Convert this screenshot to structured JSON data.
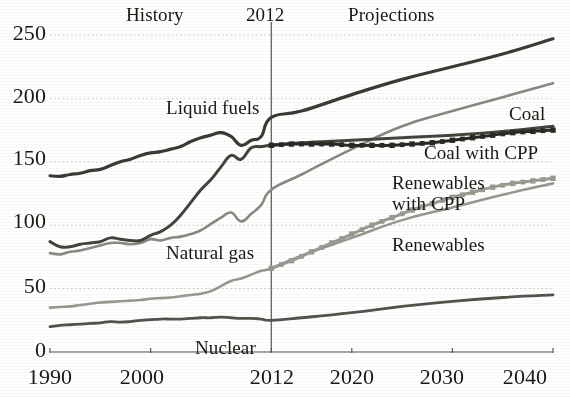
{
  "chart_data": {
    "type": "line",
    "title": "",
    "subtitle": "",
    "xlabel": "",
    "ylabel": "",
    "xlim": [
      1990,
      2040
    ],
    "ylim": [
      0,
      250
    ],
    "yticks": [
      0,
      50,
      100,
      150,
      200,
      250
    ],
    "xticks": [
      1990,
      2000,
      2012,
      2020,
      2030,
      2040
    ],
    "ytick_labels": [
      "0",
      "50",
      "100",
      "150",
      "200",
      "250"
    ],
    "xtick_labels": [
      "1990",
      "2000",
      "2012",
      "2020",
      "2030",
      "2040"
    ],
    "grid": "horizontal-dotted",
    "legend": "inline-annotations",
    "annotations": [
      {
        "name": "history-label",
        "text": "History",
        "x": 1997.2,
        "y": 262
      },
      {
        "name": "divider-year-label",
        "text": "2012",
        "x": 2012,
        "y": 262
      },
      {
        "name": "projections-label",
        "text": "Projections",
        "x": 2027.5,
        "y": 262
      }
    ],
    "divider_x": 2012,
    "series": [
      {
        "name": "Liquid fuels",
        "label": "Liquid fuels",
        "style": "solid",
        "color": "#3d3a34",
        "width": 3.2,
        "label_pos": {
          "x": 2001.0,
          "y": 191
        },
        "x": [
          1990,
          1991,
          1992,
          1993,
          1994,
          1995,
          1996,
          1997,
          1998,
          1999,
          2000,
          2001,
          2002,
          2003,
          2004,
          2005,
          2006,
          2007,
          2008,
          2009,
          2010,
          2011,
          2012,
          2015,
          2020,
          2025,
          2030,
          2035,
          2040
        ],
        "y": [
          139,
          138.5,
          140,
          141,
          143,
          144,
          147,
          150,
          152,
          155,
          157,
          158,
          160,
          162,
          166,
          169,
          171,
          173,
          170,
          163,
          167,
          170,
          185,
          190,
          203,
          215,
          225,
          235,
          247
        ]
      },
      {
        "name": "Natural gas",
        "label": "Natural gas",
        "style": "solid",
        "color": "#8b8881",
        "width": 2.6,
        "label_pos": {
          "x": 2002.0,
          "y": 82
        },
        "x": [
          1990,
          1991,
          1992,
          1993,
          1994,
          1995,
          1996,
          1997,
          1998,
          1999,
          2000,
          2001,
          2002,
          2003,
          2004,
          2005,
          2006,
          2007,
          2008,
          2009,
          2010,
          2011,
          2012,
          2015,
          2020,
          2025,
          2030,
          2035,
          2040
        ],
        "y": [
          78,
          77,
          79,
          80,
          82,
          84,
          86,
          86,
          85,
          86,
          89,
          88,
          90,
          91,
          93,
          96,
          101,
          106,
          110,
          103,
          109,
          116,
          128,
          140,
          160,
          178,
          190,
          201,
          212
        ]
      },
      {
        "name": "Coal",
        "label": "Coal",
        "style": "solid",
        "color": "#46433c",
        "width": 3.0,
        "label_pos": {
          "x": 2035.5,
          "y": 180
        },
        "x": [
          1990,
          1991,
          1992,
          1993,
          1994,
          1995,
          1996,
          1997,
          1998,
          1999,
          2000,
          2001,
          2002,
          2003,
          2004,
          2005,
          2006,
          2007,
          2008,
          2009,
          2010,
          2011,
          2012,
          2015,
          2020,
          2025,
          2030,
          2035,
          2040
        ],
        "y": [
          87,
          83,
          83,
          85,
          86,
          87,
          90,
          89,
          88,
          88,
          92,
          95,
          100,
          108,
          118,
          128,
          136,
          146,
          155,
          152,
          161,
          162,
          163,
          165,
          167,
          169,
          171,
          174,
          178
        ]
      },
      {
        "name": "Coal with CPP",
        "label": "Coal with CPP",
        "style": "dotted-markers",
        "color": "#2b2924",
        "width": 3.0,
        "label_pos": {
          "x": 2030.5,
          "y": 162
        },
        "x": [
          2012,
          2014,
          2016,
          2018,
          2020,
          2022,
          2024,
          2026,
          2028,
          2030,
          2032,
          2034,
          2036,
          2038,
          2040
        ],
        "y": [
          163,
          164,
          164,
          164,
          163,
          163,
          163,
          164,
          165,
          167,
          169,
          171,
          173,
          174,
          175
        ]
      },
      {
        "name": "Renewables",
        "label": "Renewables",
        "style": "solid",
        "color": "#9a978f",
        "width": 2.6,
        "label_pos": {
          "x": 2027.0,
          "y": 105
        },
        "x": [
          1990,
          1991,
          1992,
          1993,
          1994,
          1995,
          1996,
          1997,
          1998,
          1999,
          2000,
          2001,
          2002,
          2003,
          2004,
          2005,
          2006,
          2007,
          2008,
          2009,
          2010,
          2011,
          2012,
          2015,
          2020,
          2025,
          2030,
          2035,
          2040
        ],
        "y": [
          35,
          35.5,
          36,
          37,
          38,
          39,
          39.5,
          40,
          40.5,
          41,
          42,
          42.5,
          43,
          44,
          45,
          46,
          48,
          52,
          56,
          58,
          61,
          64,
          66,
          76,
          90,
          104,
          114,
          124,
          133
        ]
      },
      {
        "name": "Renewables with CPP",
        "label": "Renewables with CPP",
        "style": "dotted-markers",
        "color": "#9c9990",
        "width": 3.0,
        "label_pos": {
          "x": 2021.0,
          "y": 135
        },
        "x": [
          2012,
          2014,
          2016,
          2018,
          2020,
          2022,
          2024,
          2026,
          2028,
          2030,
          2032,
          2034,
          2036,
          2038,
          2040
        ],
        "y": [
          66,
          72,
          79,
          86,
          93,
          100,
          106,
          112,
          117,
          122,
          126,
          130,
          133,
          135,
          137
        ]
      },
      {
        "name": "Nuclear",
        "label": "Nuclear",
        "style": "solid",
        "color": "#55524b",
        "width": 2.8,
        "label_pos": {
          "x": 2009.0,
          "y": 10
        },
        "x": [
          1990,
          1991,
          1992,
          1993,
          1994,
          1995,
          1996,
          1997,
          1998,
          1999,
          2000,
          2001,
          2002,
          2003,
          2004,
          2005,
          2006,
          2007,
          2008,
          2009,
          2010,
          2011,
          2012,
          2015,
          2020,
          2025,
          2030,
          2035,
          2040
        ],
        "y": [
          20,
          21,
          21.5,
          22,
          22.5,
          23,
          24,
          23.5,
          24,
          25,
          25.5,
          26,
          26,
          26,
          26.5,
          27,
          27,
          27.5,
          27,
          26.5,
          26.5,
          26,
          25,
          27,
          31,
          36,
          40,
          43,
          45
        ]
      }
    ]
  },
  "axes": {
    "y_label_ids": [
      "y-250",
      "y-200",
      "y-150",
      "y-100",
      "y-50",
      "y-0"
    ],
    "x_label_ids": [
      "x-1990",
      "x-2000",
      "x-2012",
      "x-2020",
      "x-2030",
      "x-2040"
    ]
  },
  "colors": {
    "axis": "#5d5a53",
    "gridline": "#cfccc4",
    "divider": "#6e6b64",
    "background": "#ffffff",
    "text": "#17150f"
  }
}
